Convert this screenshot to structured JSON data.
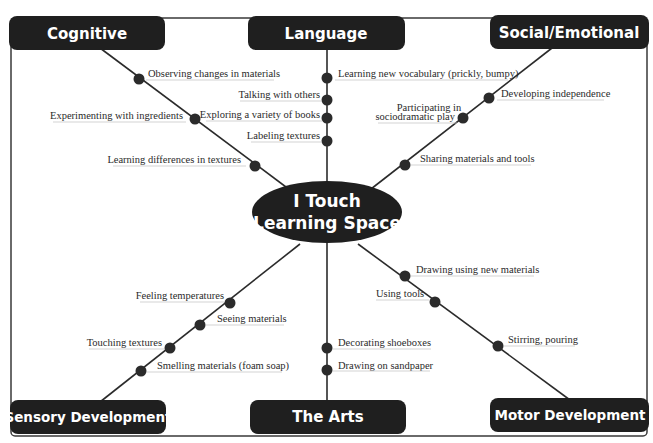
{
  "diagram": {
    "center": {
      "line1": "I Touch",
      "line2": "Learning Space"
    },
    "categories": {
      "cognitive": {
        "label": "Cognitive",
        "items": [
          "Observing changes in materials",
          "Experimenting with ingredients",
          "Learning differences in textures"
        ]
      },
      "language": {
        "label": "Language",
        "items": [
          "Learning new vocabulary (prickly, bumpy)",
          "Talking  with others",
          "Exploring a variety of books",
          "Labeling textures"
        ]
      },
      "social_emotional": {
        "label": "Social/Emotional",
        "items": [
          "Developing independence",
          "Participating in",
          "sociodramatic play",
          "Sharing materials and tools"
        ]
      },
      "sensory": {
        "label": "Sensory Development",
        "items": [
          "Feeling temperatures",
          "Seeing materials",
          "Touching textures",
          "Smelling materials (foam soap)"
        ]
      },
      "arts": {
        "label": "The Arts",
        "items": [
          "Decorating shoeboxes",
          "Drawing on sandpaper"
        ]
      },
      "motor": {
        "label": "Motor Development",
        "items": [
          "Drawing using new materials",
          "Using tools",
          "Stirring, pouring"
        ]
      }
    },
    "colors": {
      "box_fill": "#1f1f1f",
      "line": "#2b2b2b",
      "text": "#2a2a2a",
      "background": "#ffffff"
    }
  }
}
